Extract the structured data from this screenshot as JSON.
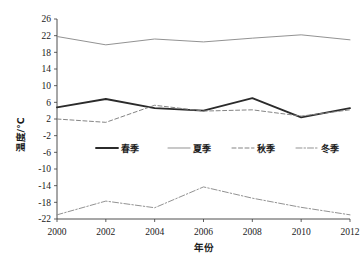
{
  "chart_data": {
    "type": "line",
    "title": "",
    "xlabel": "年份",
    "ylabel": "温度/℃",
    "x": [
      2000,
      2002,
      2004,
      2006,
      2008,
      2010,
      2012
    ],
    "xlim": [
      2000,
      2012
    ],
    "ylim": [
      -22,
      26
    ],
    "yticks": [
      26,
      22,
      18,
      14,
      10,
      6,
      2,
      -2,
      -6,
      -10,
      -14,
      -18,
      -22
    ],
    "xticks": [
      2000,
      2002,
      2004,
      2006,
      2008,
      2010,
      2012
    ],
    "xtick_labels": [
      "2000",
      "2002",
      "2004",
      "2006",
      "2008",
      "2010",
      "2012"
    ],
    "ytick_labels": [
      "26",
      "22",
      "18",
      "14",
      "10",
      "6",
      "2",
      "-2",
      "-6",
      "-10",
      "-14",
      "-18",
      "-22"
    ],
    "grid": false,
    "legend_position": "center",
    "series": [
      {
        "name": "春季",
        "style": "solid-thick",
        "color": "#2b2b2b",
        "values": [
          4.8,
          6.8,
          4.6,
          4.0,
          7.0,
          2.4,
          4.6
        ]
      },
      {
        "name": "夏季",
        "style": "solid-thin",
        "color": "#8c8c8c",
        "values": [
          21.8,
          19.8,
          21.2,
          20.5,
          21.4,
          22.2,
          21.0
        ]
      },
      {
        "name": "秋季",
        "style": "dashed",
        "color": "#7d7d7d",
        "values": [
          2.0,
          1.2,
          5.3,
          3.9,
          4.2,
          2.7,
          4.2
        ]
      },
      {
        "name": "冬季",
        "style": "dash-dot",
        "color": "#8c8c8c",
        "values": [
          -21.0,
          -17.7,
          -19.3,
          -14.3,
          -17.0,
          -19.2,
          -21.0
        ]
      }
    ]
  },
  "legend": {
    "items": [
      {
        "label": "春季"
      },
      {
        "label": "夏季"
      },
      {
        "label": "秋季"
      },
      {
        "label": "冬季"
      }
    ]
  }
}
